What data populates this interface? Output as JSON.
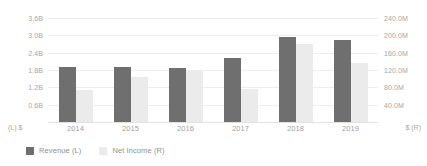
{
  "chart_data": {
    "type": "bar",
    "title": "",
    "subtitle": "",
    "xlabel": "",
    "categories": [
      "2014",
      "2015",
      "2016",
      "2017",
      "2018",
      "2019"
    ],
    "grid": true,
    "legend_position": "bottom-left",
    "series": [
      {
        "name": "Revenue (L)",
        "axis": "left",
        "color": "#6f6f6f",
        "unit": "USD",
        "values": [
          1.92,
          1.9,
          1.88,
          2.2,
          2.95,
          2.85
        ],
        "value_labels": [
          "1.92B",
          "1.90B",
          "1.88B",
          "2.20B",
          "2.95B",
          "2.85B"
        ]
      },
      {
        "name": "Net Income (R)",
        "axis": "right",
        "color": "#ebebeb",
        "unit": "USD",
        "values": [
          74.0,
          104.0,
          118.0,
          76.0,
          180.0,
          136.0
        ],
        "value_labels": [
          "74.0M",
          "104.0M",
          "118.0M",
          "76.0M",
          "180.0M",
          "136.0M"
        ]
      }
    ],
    "left_axis": {
      "label": "(L) $",
      "ylabel": "",
      "ylim": [
        0,
        3.6
      ],
      "ticks": [
        3.6,
        3.0,
        2.4,
        1.8,
        1.2,
        0.6
      ],
      "tick_labels": [
        "3.6B",
        "3.0B",
        "2.4B",
        "1.8B",
        "1.2B",
        "0.6B"
      ]
    },
    "right_axis": {
      "label": "$ (R)",
      "ylabel": "",
      "ylim": [
        0,
        240
      ],
      "ticks": [
        240,
        200,
        160,
        120,
        80,
        40
      ],
      "tick_labels": [
        "240.0M",
        "200.0M",
        "160.0M",
        "120.0M",
        "80.0M",
        "40.0M"
      ]
    }
  },
  "legend": {
    "items": [
      {
        "label": "Revenue (L)",
        "color": "#6f6f6f"
      },
      {
        "label": "Net Income (R)",
        "color": "#ebebeb"
      }
    ]
  }
}
